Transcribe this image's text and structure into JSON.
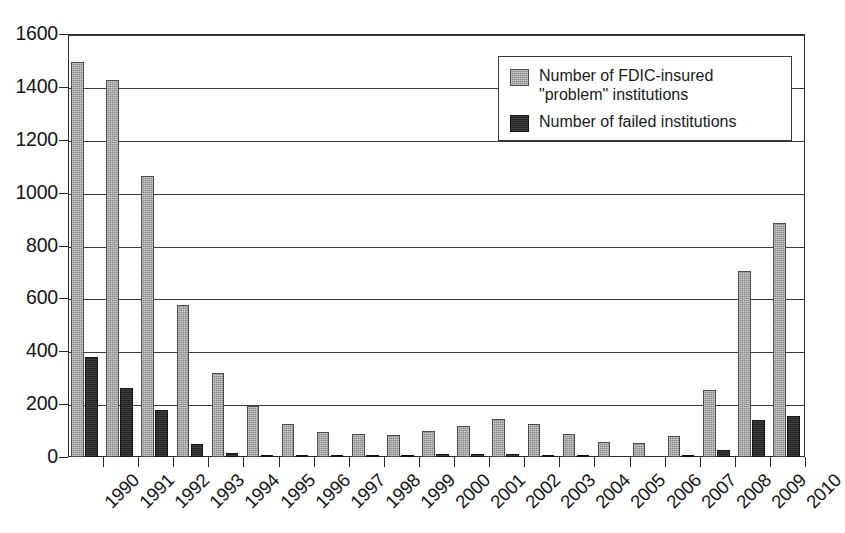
{
  "chart_data": {
    "type": "bar",
    "title": "",
    "subtitle": "",
    "xlabel": "",
    "ylabel": "",
    "ylim": [
      0,
      1600
    ],
    "ytick_step": 200,
    "yticks": [
      0,
      200,
      400,
      600,
      800,
      1000,
      1200,
      1400,
      1600
    ],
    "grid": true,
    "grid_axis": "y",
    "legend_position": "top-right",
    "categories": [
      "1990",
      "1991",
      "1992",
      "1993",
      "1994",
      "1995",
      "1996",
      "1997",
      "1998",
      "1999",
      "2000",
      "2001",
      "2002",
      "2003",
      "2004",
      "2005",
      "2006",
      "2007",
      "2008",
      "2009",
      "2010"
    ],
    "series": [
      {
        "name": "Number of FDIC-insured \"problem\" institutions",
        "color": "#9a9a9a",
        "values": [
          1496,
          1426,
          1063,
          576,
          318,
          193,
          125,
          95,
          87,
          83,
          98,
          117,
          142,
          123,
          86,
          57,
          53,
          78,
          252,
          702,
          884
        ]
      },
      {
        "name": "Number of failed institutions",
        "color": "#2a2a2a",
        "values": [
          377,
          261,
          179,
          50,
          15,
          8,
          6,
          5,
          7,
          8,
          10,
          11,
          12,
          5,
          4,
          0,
          0,
          5,
          26,
          141,
          157
        ]
      }
    ]
  },
  "legend": {
    "entries": [
      {
        "label": "Number of FDIC-insured \"problem\" institutions",
        "swatch": "gray-swatch-icon"
      },
      {
        "label": "Number of failed institutions",
        "swatch": "black-swatch-icon"
      }
    ]
  },
  "colors": {
    "series_problem": "#9a9a9a",
    "series_failed": "#2a2a2a",
    "axis": "#2b2b2b",
    "grid": "#3b3b3b",
    "background": "#ffffff"
  }
}
